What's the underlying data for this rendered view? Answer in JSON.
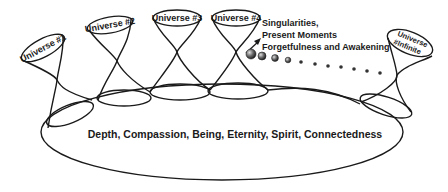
{
  "diagram": {
    "universes": [
      {
        "label": "Universe #1"
      },
      {
        "label": "Universe #2"
      },
      {
        "label": "Universe #3"
      },
      {
        "label": "Universe #4"
      },
      {
        "label_line1": "Universe",
        "label_line2": "#Infinite"
      }
    ],
    "annotation": {
      "line1": "Singularities,",
      "line2": "Present Moments",
      "line3": "Forgetfulness and Awakening"
    },
    "base_label": "Depth, Compassion, Being, Eternity, Spirit, Connectedness",
    "colors": {
      "stroke": "#1a1a1a",
      "sphere_fill": "#555555",
      "background": "#ffffff"
    }
  }
}
